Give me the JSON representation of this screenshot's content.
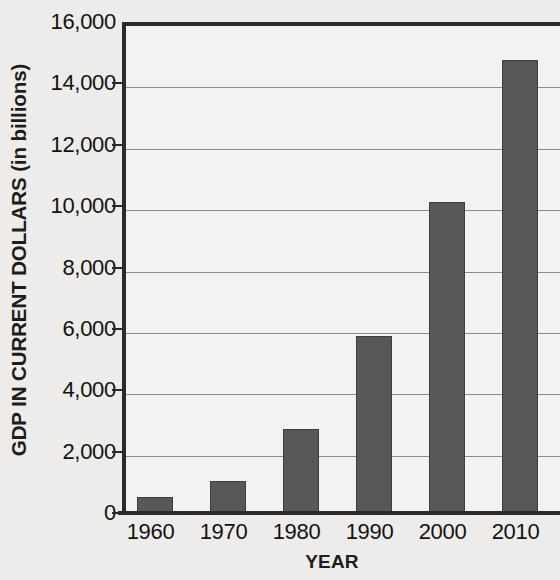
{
  "chart_data": {
    "type": "bar",
    "title": "",
    "xlabel": "YEAR",
    "ylabel": "GDP IN CURRENT DOLLARS (in billions)",
    "categories": [
      "1960",
      "1970",
      "1980",
      "1990",
      "2000",
      "2010"
    ],
    "values": [
      520,
      1040,
      2740,
      5770,
      10130,
      14760
    ],
    "ylim": [
      0,
      16000
    ],
    "ytick_values": [
      0,
      2000,
      4000,
      6000,
      8000,
      10000,
      12000,
      14000,
      16000
    ],
    "ytick_labels": [
      "0",
      "2,000",
      "4,000",
      "6,000",
      "8,000",
      "10,000",
      "12,000",
      "14,000",
      "16,000"
    ],
    "grid": "horizontal",
    "legend": null,
    "colors": {
      "bar": "#575757",
      "bar_edge": "#3e3e3e",
      "axis": "#2b2b2b",
      "gridline": "#8b8b8b",
      "plot_background": "#f3f2f0",
      "page_background": "#efeeec",
      "text": "#121212"
    }
  }
}
